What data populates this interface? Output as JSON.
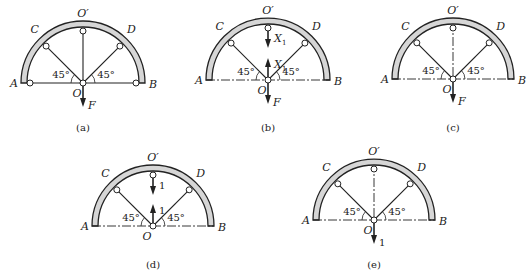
{
  "figures": [
    {
      "id": "a",
      "caption": "(a)",
      "points": {
        "A": "A",
        "B": "B",
        "C": "C",
        "D": "D",
        "O": "O",
        "Oprime": "O′"
      },
      "angle_left": "45°",
      "angle_right": "45°",
      "base_line": "solid",
      "vertical_member": "solid",
      "end_nodes": true,
      "arrows": [
        {
          "dir": "down",
          "at": "O",
          "label": "F"
        }
      ]
    },
    {
      "id": "b",
      "caption": "(b)",
      "points": {
        "A": "A",
        "B": "B",
        "C": "C",
        "D": "D",
        "O": "O",
        "Oprime": "O′"
      },
      "angle_left": "45°",
      "angle_right": "45°",
      "base_line": "dashdot",
      "vertical_member": "cut",
      "end_nodes": false,
      "arrows": [
        {
          "dir": "down",
          "at": "Oprime",
          "label": "X",
          "sub": "1"
        },
        {
          "dir": "up",
          "at": "O",
          "label": "X",
          "sub": "1"
        },
        {
          "dir": "down",
          "at": "O",
          "label": "F"
        }
      ]
    },
    {
      "id": "c",
      "caption": "(c)",
      "points": {
        "A": "A",
        "B": "B",
        "C": "C",
        "D": "D",
        "O": "O",
        "Oprime": "O′"
      },
      "angle_left": "45°",
      "angle_right": "45°",
      "base_line": "dashdot",
      "vertical_member": "dashdot",
      "end_nodes": false,
      "arrows": [
        {
          "dir": "down",
          "at": "O",
          "label": "F"
        }
      ]
    },
    {
      "id": "d",
      "caption": "(d)",
      "points": {
        "A": "A",
        "B": "B",
        "C": "C",
        "D": "D",
        "O": "O",
        "Oprime": "O′"
      },
      "angle_left": "45°",
      "angle_right": "45°",
      "base_line": "dashdot",
      "vertical_member": "cut",
      "end_nodes": false,
      "arrows": [
        {
          "dir": "down",
          "at": "Oprime",
          "label": "1",
          "upright": true
        },
        {
          "dir": "up",
          "at": "O",
          "label": "1",
          "upright": true
        }
      ]
    },
    {
      "id": "e",
      "caption": "(e)",
      "points": {
        "A": "A",
        "B": "B",
        "C": "C",
        "D": "D",
        "O": "O",
        "Oprime": "O′"
      },
      "angle_left": "45°",
      "angle_right": "45°",
      "base_line": "dashdot",
      "vertical_member": "dashdot",
      "end_nodes": false,
      "arrows": [
        {
          "dir": "down",
          "at": "O",
          "label": "1",
          "upright": true
        }
      ]
    }
  ],
  "colors": {
    "arch_fill": "#d6d6d6",
    "stroke": "#222222"
  }
}
